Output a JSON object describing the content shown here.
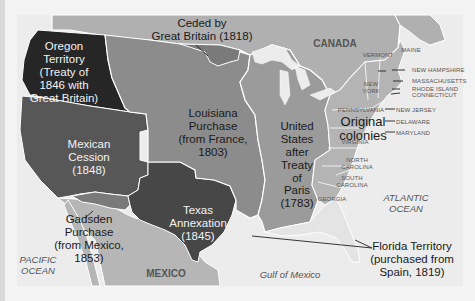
{
  "map": {
    "title": "Territorial Expansion of the United States",
    "colors": {
      "water": "#eeeeee",
      "canada": "#b3b3b3",
      "mexico": "#b8b8b8",
      "oregon": "#2a2a2a",
      "mexican_cession": "#585858",
      "texas": "#484848",
      "gadsden": "#7a7a7a",
      "louisiana": "#8e8e8e",
      "ceded_gb": "#7c7c7c",
      "treaty_paris": "#9c9c9c",
      "original_colonies": "#b6b6b6",
      "florida": "#e6e6e6",
      "border": "#ffffff"
    },
    "regions": {
      "ceded_by_gb": "Ceded by Great Britain (1818)",
      "ceded_by_gb_l1": "Ceded by",
      "ceded_by_gb_l2": "Great Britain (1818)",
      "oregon_l1": "Oregon",
      "oregon_l2": "Territory",
      "oregon_l3": "(Treaty of",
      "oregon_l4": "1846 with",
      "oregon_l5": "Great Britain)",
      "louisiana_l1": "Louisiana",
      "louisiana_l2": "Purchase",
      "louisiana_l3": "(from France,",
      "louisiana_l4": "1803)",
      "us_paris_l1": "United",
      "us_paris_l2": "States",
      "us_paris_l3": "after",
      "us_paris_l4": "Treaty",
      "us_paris_l5": "of",
      "us_paris_l6": "Paris",
      "us_paris_l7": "(1783)",
      "original_l1": "Original",
      "original_l2": "colonies",
      "cession_l1": "Mexican",
      "cession_l2": "Cession",
      "cession_l3": "(1848)",
      "texas_l1": "Texas",
      "texas_l2": "Annexation",
      "texas_l3": "(1845)",
      "gadsden_l1": "Gadsden",
      "gadsden_l2": "Purchase",
      "gadsden_l3": "(from Mexico,",
      "gadsden_l4": "1853)",
      "florida_l1": "Florida Territory",
      "florida_l2": "(purchased from",
      "florida_l3": "Spain, 1819)"
    },
    "countries": {
      "canada": "CANADA",
      "mexico": "MEXICO"
    },
    "water_bodies": {
      "pacific_l1": "PACIFIC",
      "pacific_l2": "OCEAN",
      "atlantic_l1": "ATLANTIC",
      "atlantic_l2": "OCEAN",
      "gulf": "Gulf of Mexico"
    },
    "states": {
      "vermont": "VERMONT",
      "maine": "MAINE",
      "new_hampshire": "NEW HAMPSHIRE",
      "new_york_l1": "NEW",
      "new_york_l2": "YORK",
      "massachusetts": "MASSACHUSETTS",
      "rhode_island": "RHODE ISLAND",
      "connecticut": "CONNECTICUT",
      "pennsylvania": "PENNSYLVANIA",
      "new_jersey": "NEW JERSEY",
      "delaware": "DELAWARE",
      "maryland": "MARYLAND",
      "virginia": "VIRGINIA",
      "north_carolina_l1": "NORTH",
      "north_carolina_l2": "CAROLINA",
      "south_carolina_l1": "SOUTH",
      "south_carolina_l2": "CAROLINA",
      "georgia": "GEORGIA"
    }
  }
}
